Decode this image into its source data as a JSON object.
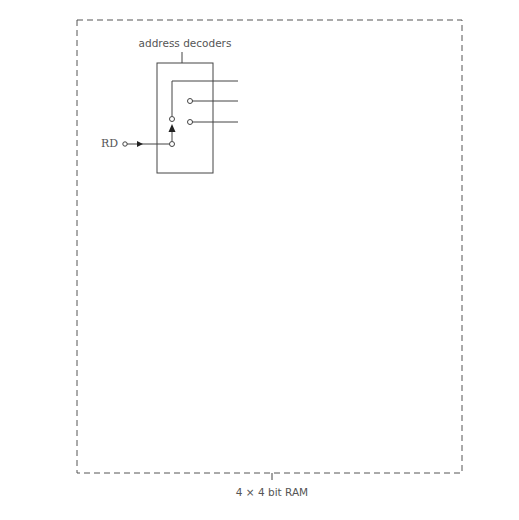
{
  "title": "4 × 4 bit RAM",
  "labels": {
    "address_decoders": "address decoders",
    "memory_store": "memory store",
    "control_logic": "control logic"
  },
  "inputs": {
    "a1": {
      "base": "A",
      "sub": "1"
    },
    "a0": {
      "base": "A",
      "sub": "0"
    },
    "ce": "CE",
    "rw": {
      "r": "R/",
      "w": "W"
    },
    "rd": "RD",
    "wr": "WR"
  },
  "read_decoder": {
    "address_pins": [
      {
        "base": "A",
        "sub": "0"
      },
      {
        "base": "A",
        "sub": "1"
      }
    ],
    "outputs": [
      {
        "base": "R",
        "sub": "3"
      },
      {
        "base": "R",
        "sub": "2"
      },
      {
        "base": "R",
        "sub": "1"
      },
      {
        "base": "R",
        "sub": "0"
      }
    ]
  },
  "write_decoder": {
    "address_pins": [
      {
        "base": "A",
        "sub": "0"
      },
      {
        "base": "A",
        "sub": "1"
      }
    ],
    "outputs": [
      {
        "base": "W",
        "sub": "3"
      },
      {
        "base": "W",
        "sub": "2"
      },
      {
        "base": "W",
        "sub": "1"
      },
      {
        "base": "W",
        "sub": "0"
      }
    ]
  },
  "control_outputs": [
    "RD",
    "WR"
  ],
  "memory_cells": [
    {
      "name": {
        "base": "M",
        "sub": "3"
      },
      "r": {
        "base": "R",
        "sub": "3"
      },
      "w": {
        "base": "W",
        "sub": "3"
      },
      "r_pin": "R",
      "w_pin": "W"
    },
    {
      "name": {
        "base": "M",
        "sub": "2"
      },
      "r": {
        "base": "R",
        "sub": "2"
      },
      "w": {
        "base": "W",
        "sub": "2"
      },
      "r_pin": "R",
      "w_pin": "W"
    },
    {
      "name": {
        "base": "M",
        "sub": "1"
      },
      "r": {
        "base": "R",
        "sub": "1"
      },
      "w": {
        "base": "W",
        "sub": "1"
      },
      "r_pin": "R",
      "w_pin": "W"
    },
    {
      "name": {
        "base": "M",
        "sub": "0"
      },
      "r": {
        "base": "R",
        "sub": "0"
      },
      "w": {
        "base": "W",
        "sub": "0"
      },
      "r_pin": "R",
      "w_pin": "W"
    }
  ],
  "data_lines": [
    {
      "base": "D",
      "sub": "3"
    },
    {
      "base": "D",
      "sub": "2"
    },
    {
      "base": "D",
      "sub": "1"
    },
    {
      "base": "D",
      "sub": "0"
    }
  ]
}
